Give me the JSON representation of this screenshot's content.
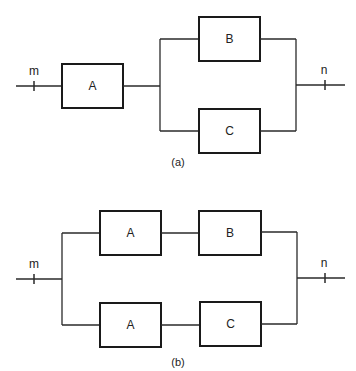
{
  "diagrams": [
    {
      "caption": "(a)",
      "input_node": "m",
      "output_node": "n",
      "blocks": [
        {
          "label": "A",
          "position": "series"
        },
        {
          "label": "B",
          "position": "parallel-top"
        },
        {
          "label": "C",
          "position": "parallel-bottom"
        }
      ]
    },
    {
      "caption": "(b)",
      "input_node": "m",
      "output_node": "n",
      "blocks": [
        {
          "label": "A",
          "position": "top-branch-1"
        },
        {
          "label": "B",
          "position": "top-branch-2"
        },
        {
          "label": "A",
          "position": "bottom-branch-1"
        },
        {
          "label": "C",
          "position": "bottom-branch-2"
        }
      ]
    }
  ],
  "colors": {
    "stroke": "#1a1a1a",
    "background": "#ffffff"
  }
}
